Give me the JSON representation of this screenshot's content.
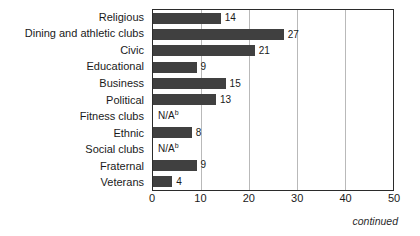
{
  "chart_data": {
    "type": "bar",
    "orientation": "horizontal",
    "title": "",
    "xlabel": "",
    "ylabel": "",
    "xlim": [
      0,
      50
    ],
    "xticks": [
      "0",
      "10",
      "20",
      "30",
      "40",
      "50"
    ],
    "grid": true,
    "legend": null,
    "bar_color": "#404040",
    "categories": [
      "Religious",
      "Dining and athletic clubs",
      "Civic",
      "Educational",
      "Business",
      "Political",
      "Fitness clubs",
      "Ethnic",
      "Social clubs",
      "Fraternal",
      "Veterans"
    ],
    "values": [
      14,
      27,
      21,
      9,
      15,
      13,
      null,
      8,
      null,
      9,
      4
    ],
    "value_labels": [
      "14",
      "27",
      "21",
      "9",
      "15",
      "13",
      "N/A",
      "8",
      "N/A",
      "9",
      "4"
    ],
    "missing_marker": "N/A",
    "missing_footnote": "b",
    "annotations": {
      "continued": "continued"
    }
  }
}
